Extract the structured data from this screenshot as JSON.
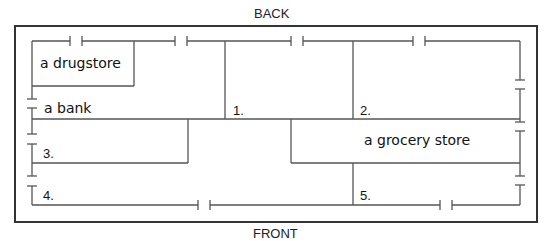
{
  "labels": {
    "back": "BACK",
    "front": "FRONT"
  },
  "stores": {
    "drugstore": "a drugstore",
    "bank": "a bank",
    "grocery": "a grocery store"
  },
  "blanks": [
    "1.",
    "2.",
    "3.",
    "4.",
    "5."
  ],
  "colors": {
    "line": "#555555",
    "border": "#333333",
    "text": "#111111"
  }
}
